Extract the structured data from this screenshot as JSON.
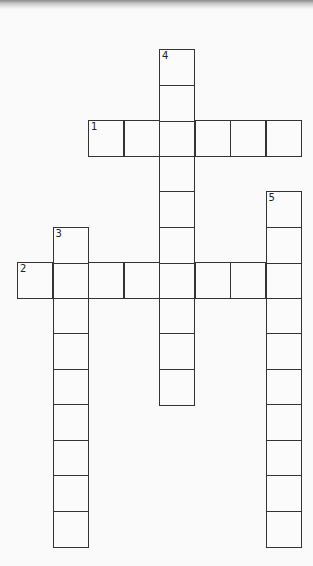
{
  "puzzle": {
    "type": "crossword",
    "cell_size": 35.5,
    "origin_x": 17,
    "origin_y": 49,
    "entries": [
      {
        "number": "1",
        "direction": "across",
        "row": 2,
        "col": 2,
        "length": 6
      },
      {
        "number": "2",
        "direction": "across",
        "row": 6,
        "col": 0,
        "length": 8
      },
      {
        "number": "3",
        "direction": "down",
        "row": 5,
        "col": 1,
        "length": 9
      },
      {
        "number": "4",
        "direction": "down",
        "row": 0,
        "col": 4,
        "length": 10
      },
      {
        "number": "5",
        "direction": "down",
        "row": 4,
        "col": 7,
        "length": 10
      }
    ]
  },
  "colors": {
    "border": "#333333",
    "background": "#fafafa"
  }
}
